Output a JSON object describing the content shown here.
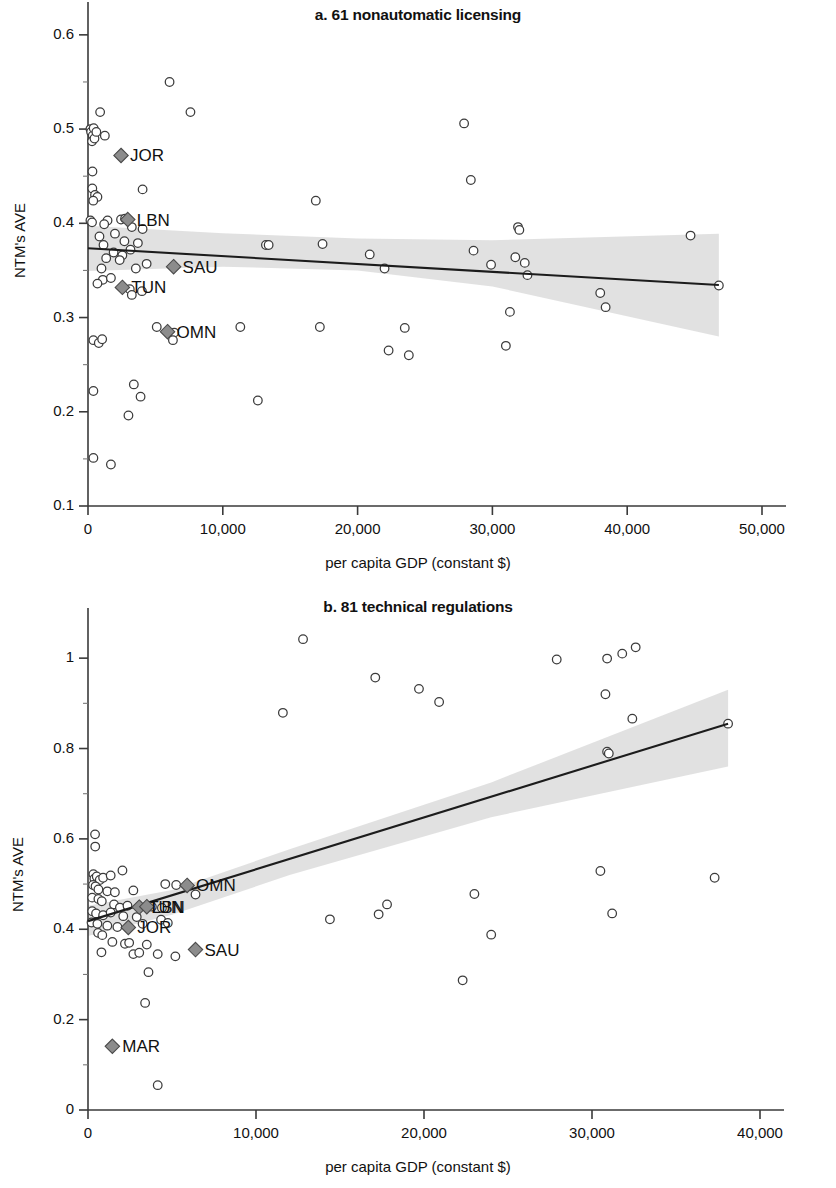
{
  "figure": {
    "panels": [
      "a",
      "b"
    ]
  },
  "panel_a": {
    "title": "a. 61 nonautomatic licensing",
    "ylabel": "NTM's AVE",
    "xlabel": "per capita GDP (constant $)",
    "y_ticks": [
      "0.6",
      "0.5",
      "0.4",
      "0.3",
      "0.2",
      "0.1"
    ],
    "x_ticks": [
      "0",
      "10,000",
      "20,000",
      "30,000",
      "40,000",
      "50,000"
    ]
  },
  "panel_b": {
    "title": "b. 81 technical regulations",
    "ylabel": "NTM's AVE",
    "xlabel": "per capita GDP (constant $)",
    "y_ticks": [
      "1",
      "0.8",
      "0.6",
      "0.4",
      "0.2",
      "0"
    ],
    "x_ticks": [
      "0",
      "10,000",
      "20,000",
      "30,000",
      "40,000"
    ]
  },
  "colors": {
    "point_stroke": "#3c3c3c",
    "point_fill": "#ffffff",
    "diamond_fill": "#8c8c8c",
    "band_fill": "#d9d9d9",
    "fit_line": "#1c1c1c",
    "axis": "#3a3a3a",
    "text": "#111111"
  },
  "chart_data": [
    {
      "type": "scatter",
      "title": "a. 61 nonautomatic licensing",
      "xlabel": "per capita GDP (constant $)",
      "ylabel": "NTM's AVE",
      "xlim": [
        0,
        50000
      ],
      "ylim": [
        0.1,
        0.62
      ],
      "grid": false,
      "legend": "none",
      "y_tick_values": [
        0.6,
        0.5,
        0.4,
        0.3,
        0.2,
        0.1
      ],
      "x_tick_values": [
        0,
        10000,
        20000,
        30000,
        40000,
        50000
      ],
      "fit_line": {
        "x": [
          0,
          46800
        ],
        "y": [
          0.3735,
          0.3345
        ],
        "description": "downward sloping OLS fit"
      },
      "confidence_band": {
        "upper": [
          [
            0,
            0.3975
          ],
          [
            10000,
            0.3895
          ],
          [
            20000,
            0.384
          ],
          [
            30000,
            0.382
          ],
          [
            46800,
            0.389
          ]
        ],
        "lower": [
          [
            0,
            0.3495
          ],
          [
            10000,
            0.354
          ],
          [
            20000,
            0.35
          ],
          [
            30000,
            0.333
          ],
          [
            46800,
            0.28
          ]
        ]
      },
      "highlighted_points": [
        {
          "label": "JOR",
          "x": 2450,
          "y": 0.472
        },
        {
          "label": "LBN",
          "x": 2950,
          "y": 0.404
        },
        {
          "label": "SAU",
          "x": 6350,
          "y": 0.354
        },
        {
          "label": "TUN",
          "x": 2550,
          "y": 0.332
        },
        {
          "label": "OMN",
          "x": 5900,
          "y": 0.285
        }
      ],
      "points": [
        {
          "x": 180,
          "y": 0.5
        },
        {
          "x": 230,
          "y": 0.497
        },
        {
          "x": 350,
          "y": 0.493
        },
        {
          "x": 420,
          "y": 0.501
        },
        {
          "x": 300,
          "y": 0.487
        },
        {
          "x": 480,
          "y": 0.49
        },
        {
          "x": 620,
          "y": 0.497
        },
        {
          "x": 900,
          "y": 0.518
        },
        {
          "x": 1250,
          "y": 0.493
        },
        {
          "x": 6050,
          "y": 0.55
        },
        {
          "x": 7600,
          "y": 0.518
        },
        {
          "x": 330,
          "y": 0.455
        },
        {
          "x": 320,
          "y": 0.437
        },
        {
          "x": 520,
          "y": 0.43
        },
        {
          "x": 700,
          "y": 0.428
        },
        {
          "x": 390,
          "y": 0.424
        },
        {
          "x": 4050,
          "y": 0.436
        },
        {
          "x": 180,
          "y": 0.403
        },
        {
          "x": 300,
          "y": 0.401
        },
        {
          "x": 1450,
          "y": 0.403
        },
        {
          "x": 2450,
          "y": 0.404
        },
        {
          "x": 2750,
          "y": 0.405
        },
        {
          "x": 1200,
          "y": 0.399
        },
        {
          "x": 3250,
          "y": 0.396
        },
        {
          "x": 4050,
          "y": 0.394
        },
        {
          "x": 850,
          "y": 0.386
        },
        {
          "x": 2000,
          "y": 0.389
        },
        {
          "x": 1150,
          "y": 0.377
        },
        {
          "x": 2700,
          "y": 0.381
        },
        {
          "x": 3700,
          "y": 0.379
        },
        {
          "x": 1900,
          "y": 0.369
        },
        {
          "x": 2550,
          "y": 0.366
        },
        {
          "x": 3150,
          "y": 0.372
        },
        {
          "x": 2350,
          "y": 0.361
        },
        {
          "x": 1350,
          "y": 0.363
        },
        {
          "x": 1000,
          "y": 0.352
        },
        {
          "x": 3550,
          "y": 0.352
        },
        {
          "x": 4350,
          "y": 0.357
        },
        {
          "x": 1100,
          "y": 0.34
        },
        {
          "x": 700,
          "y": 0.336
        },
        {
          "x": 1700,
          "y": 0.342
        },
        {
          "x": 3100,
          "y": 0.33
        },
        {
          "x": 3250,
          "y": 0.324
        },
        {
          "x": 4000,
          "y": 0.328
        },
        {
          "x": 5100,
          "y": 0.29
        },
        {
          "x": 6400,
          "y": 0.284
        },
        {
          "x": 6300,
          "y": 0.276
        },
        {
          "x": 400,
          "y": 0.276
        },
        {
          "x": 800,
          "y": 0.273
        },
        {
          "x": 1050,
          "y": 0.277
        },
        {
          "x": 400,
          "y": 0.222
        },
        {
          "x": 3400,
          "y": 0.229
        },
        {
          "x": 3900,
          "y": 0.216
        },
        {
          "x": 3000,
          "y": 0.196
        },
        {
          "x": 400,
          "y": 0.151
        },
        {
          "x": 1700,
          "y": 0.144
        },
        {
          "x": 11300,
          "y": 0.29
        },
        {
          "x": 12600,
          "y": 0.212
        },
        {
          "x": 13200,
          "y": 0.377
        },
        {
          "x": 13400,
          "y": 0.377
        },
        {
          "x": 16900,
          "y": 0.424
        },
        {
          "x": 17200,
          "y": 0.29
        },
        {
          "x": 17400,
          "y": 0.378
        },
        {
          "x": 20900,
          "y": 0.367
        },
        {
          "x": 22000,
          "y": 0.352
        },
        {
          "x": 22300,
          "y": 0.265
        },
        {
          "x": 23500,
          "y": 0.289
        },
        {
          "x": 23800,
          "y": 0.26
        },
        {
          "x": 27900,
          "y": 0.506
        },
        {
          "x": 28400,
          "y": 0.446
        },
        {
          "x": 28600,
          "y": 0.371
        },
        {
          "x": 29900,
          "y": 0.356
        },
        {
          "x": 31900,
          "y": 0.396
        },
        {
          "x": 32000,
          "y": 0.393
        },
        {
          "x": 31700,
          "y": 0.364
        },
        {
          "x": 32400,
          "y": 0.358
        },
        {
          "x": 32600,
          "y": 0.345
        },
        {
          "x": 31300,
          "y": 0.306
        },
        {
          "x": 31000,
          "y": 0.27
        },
        {
          "x": 38000,
          "y": 0.326
        },
        {
          "x": 38400,
          "y": 0.311
        },
        {
          "x": 44700,
          "y": 0.387
        },
        {
          "x": 46800,
          "y": 0.334
        }
      ]
    },
    {
      "type": "scatter",
      "title": "b. 81 technical regulations",
      "xlabel": "per capita GDP (constant $)",
      "ylabel": "NTM's AVE",
      "xlim": [
        0,
        40000
      ],
      "ylim": [
        0,
        1.08
      ],
      "grid": false,
      "legend": "none",
      "y_tick_values": [
        1.0,
        0.8,
        0.6,
        0.4,
        0.2,
        0.0
      ],
      "x_tick_values": [
        0,
        10000,
        20000,
        30000,
        40000
      ],
      "fit_line": {
        "x": [
          0,
          38100
        ],
        "y": [
          0.418,
          0.855
        ],
        "description": "upward sloping OLS fit"
      },
      "confidence_band": {
        "upper": [
          [
            0,
            0.452
          ],
          [
            5000,
            0.487
          ],
          [
            12000,
            0.577
          ],
          [
            24000,
            0.725
          ],
          [
            38100,
            0.93
          ]
        ],
        "lower": [
          [
            0,
            0.385
          ],
          [
            5000,
            0.432
          ],
          [
            12000,
            0.52
          ],
          [
            24000,
            0.648
          ],
          [
            38100,
            0.76
          ]
        ]
      },
      "highlighted_points": [
        {
          "label": "OMN",
          "x": 5900,
          "y": 0.497
        },
        {
          "label": "TUN",
          "x": 3050,
          "y": 0.449
        },
        {
          "label": "LBN",
          "x": 3500,
          "y": 0.45
        },
        {
          "label": "JOR",
          "x": 2400,
          "y": 0.404
        },
        {
          "label": "SAU",
          "x": 6400,
          "y": 0.355
        },
        {
          "label": "MAR",
          "x": 1450,
          "y": 0.141
        }
      ],
      "points": [
        {
          "x": 420,
          "y": 0.61
        },
        {
          "x": 430,
          "y": 0.583
        },
        {
          "x": 320,
          "y": 0.522
        },
        {
          "x": 380,
          "y": 0.512
        },
        {
          "x": 520,
          "y": 0.517
        },
        {
          "x": 700,
          "y": 0.509
        },
        {
          "x": 900,
          "y": 0.514
        },
        {
          "x": 1350,
          "y": 0.519
        },
        {
          "x": 2050,
          "y": 0.53
        },
        {
          "x": 300,
          "y": 0.498
        },
        {
          "x": 450,
          "y": 0.495
        },
        {
          "x": 620,
          "y": 0.488
        },
        {
          "x": 1150,
          "y": 0.484
        },
        {
          "x": 1600,
          "y": 0.482
        },
        {
          "x": 2700,
          "y": 0.486
        },
        {
          "x": 4600,
          "y": 0.5
        },
        {
          "x": 5250,
          "y": 0.498
        },
        {
          "x": 6400,
          "y": 0.477
        },
        {
          "x": 250,
          "y": 0.47
        },
        {
          "x": 620,
          "y": 0.467
        },
        {
          "x": 820,
          "y": 0.462
        },
        {
          "x": 1550,
          "y": 0.455
        },
        {
          "x": 1900,
          "y": 0.448
        },
        {
          "x": 2350,
          "y": 0.452
        },
        {
          "x": 3800,
          "y": 0.45
        },
        {
          "x": 4400,
          "y": 0.447
        },
        {
          "x": 250,
          "y": 0.44
        },
        {
          "x": 480,
          "y": 0.435
        },
        {
          "x": 900,
          "y": 0.431
        },
        {
          "x": 1350,
          "y": 0.437
        },
        {
          "x": 2100,
          "y": 0.429
        },
        {
          "x": 2900,
          "y": 0.427
        },
        {
          "x": 4350,
          "y": 0.421
        },
        {
          "x": 210,
          "y": 0.415
        },
        {
          "x": 560,
          "y": 0.412
        },
        {
          "x": 1150,
          "y": 0.408
        },
        {
          "x": 1750,
          "y": 0.405
        },
        {
          "x": 3250,
          "y": 0.412
        },
        {
          "x": 4750,
          "y": 0.414
        },
        {
          "x": 600,
          "y": 0.392
        },
        {
          "x": 850,
          "y": 0.387
        },
        {
          "x": 1450,
          "y": 0.372
        },
        {
          "x": 2200,
          "y": 0.368
        },
        {
          "x": 2450,
          "y": 0.37
        },
        {
          "x": 3500,
          "y": 0.366
        },
        {
          "x": 800,
          "y": 0.349
        },
        {
          "x": 2700,
          "y": 0.345
        },
        {
          "x": 3050,
          "y": 0.348
        },
        {
          "x": 4150,
          "y": 0.345
        },
        {
          "x": 5200,
          "y": 0.34
        },
        {
          "x": 3600,
          "y": 0.305
        },
        {
          "x": 3400,
          "y": 0.237
        },
        {
          "x": 4150,
          "y": 0.055
        },
        {
          "x": 12800,
          "y": 1.042
        },
        {
          "x": 11600,
          "y": 0.879
        },
        {
          "x": 17100,
          "y": 0.957
        },
        {
          "x": 19700,
          "y": 0.932
        },
        {
          "x": 20900,
          "y": 0.903
        },
        {
          "x": 27900,
          "y": 0.997
        },
        {
          "x": 30900,
          "y": 0.999
        },
        {
          "x": 31800,
          "y": 1.01
        },
        {
          "x": 32600,
          "y": 1.024
        },
        {
          "x": 30800,
          "y": 0.92
        },
        {
          "x": 32400,
          "y": 0.866
        },
        {
          "x": 30900,
          "y": 0.793
        },
        {
          "x": 31000,
          "y": 0.789
        },
        {
          "x": 38100,
          "y": 0.855
        },
        {
          "x": 14400,
          "y": 0.422
        },
        {
          "x": 17300,
          "y": 0.433
        },
        {
          "x": 17800,
          "y": 0.455
        },
        {
          "x": 22300,
          "y": 0.287
        },
        {
          "x": 23000,
          "y": 0.478
        },
        {
          "x": 24000,
          "y": 0.388
        },
        {
          "x": 30500,
          "y": 0.529
        },
        {
          "x": 31200,
          "y": 0.435
        },
        {
          "x": 37300,
          "y": 0.514
        }
      ]
    }
  ]
}
